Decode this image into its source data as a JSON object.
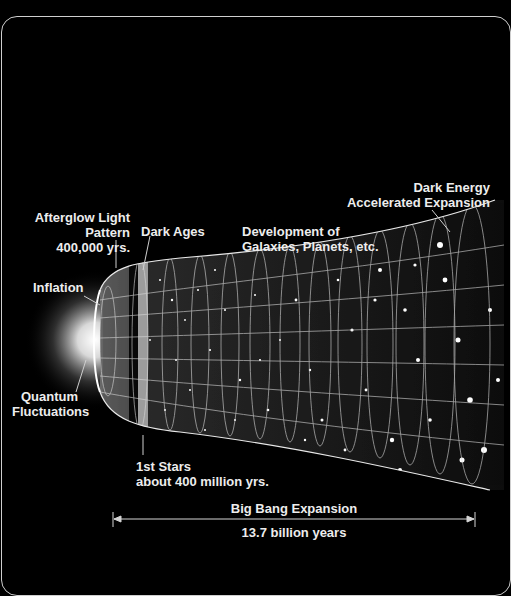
{
  "diagram": {
    "title": "Big Bang Expansion",
    "duration": "13.7 billion years",
    "labels": {
      "afterglow": [
        "Afterglow Light",
        "Pattern",
        "400,000 yrs."
      ],
      "dark_ages": "Dark Ages",
      "development": [
        "Development of",
        "Galaxies, Planets, etc."
      ],
      "dark_energy": [
        "Dark Energy",
        "Accelerated Expansion"
      ],
      "inflation": "Inflation",
      "quantum": [
        "Quantum",
        "Fluctuations"
      ],
      "first_stars": [
        "1st Stars",
        "about 400 million yrs."
      ]
    },
    "colors": {
      "background": "#000000",
      "text": "#ededed",
      "grid": "#d8d8d8",
      "frame": "#cfcfcf"
    }
  }
}
